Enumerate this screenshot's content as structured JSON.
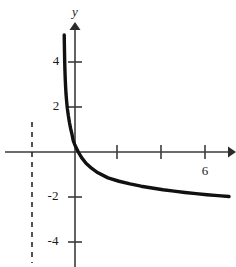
{
  "figure": {
    "background_color": "#ffffff",
    "curve_color": "#111111",
    "axis_color": "#3b3b3b",
    "asymptote_color": "#1a1a1a"
  },
  "axes": {
    "y_axis_label": "y",
    "x_axis_label": "",
    "y_tick_labels": [
      "4",
      "2",
      "-2",
      "-4"
    ],
    "x_tick_labels": [
      "6"
    ]
  },
  "chart_data": {
    "type": "line",
    "title": "",
    "subtitle": "",
    "xlabel": "",
    "ylabel": "y",
    "xlim": [
      -1.2,
      7.0
    ],
    "ylim": [
      -5.2,
      5.6
    ],
    "grid": false,
    "legend": null,
    "x_ticks": [
      2,
      4,
      6
    ],
    "x_tick_labels": [
      "",
      "",
      "6"
    ],
    "y_ticks": [
      4,
      2,
      -2,
      -4
    ],
    "y_tick_labels": [
      "4",
      "2",
      "-2",
      "-4"
    ],
    "annotations": [
      {
        "name": "vertical-asymptote",
        "type": "vline",
        "x": -0.5,
        "style": "dashed",
        "label": ""
      }
    ],
    "series": [
      {
        "name": "curve",
        "description": "decreasing logarithmic curve with vertical asymptote at x = -0.5",
        "x": [
          -0.49,
          -0.48,
          -0.47,
          -0.46,
          -0.45,
          -0.43,
          -0.41,
          -0.38,
          -0.35,
          -0.3,
          -0.25,
          -0.2,
          -0.14,
          -0.08,
          0.0,
          0.15,
          0.3,
          0.5,
          0.75,
          1.0,
          1.5,
          2.0,
          2.5,
          3.0,
          3.5,
          4.0,
          4.5,
          5.0,
          5.5,
          6.0,
          6.5,
          7.0
        ],
        "y": [
          5.2,
          4.6,
          4.1,
          3.7,
          3.4,
          2.95,
          2.6,
          2.25,
          1.95,
          1.6,
          1.3,
          1.05,
          0.8,
          0.5,
          0.3,
          0.0,
          -0.25,
          -0.5,
          -0.72,
          -0.9,
          -1.15,
          -1.3,
          -1.42,
          -1.52,
          -1.6,
          -1.68,
          -1.74,
          -1.8,
          -1.85,
          -1.9,
          -1.94,
          -1.98
        ]
      }
    ]
  }
}
